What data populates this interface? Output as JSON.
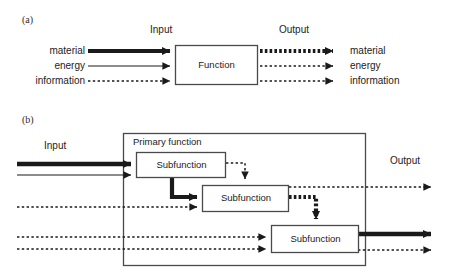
{
  "figure": {
    "background": "#ffffff",
    "stroke_color": "#1a1a1a",
    "box_fill": "#ffffff"
  },
  "panel_a": {
    "id": "(a)",
    "input_heading": "Input",
    "output_heading": "Output",
    "function_box_label": "Function",
    "input_labels": [
      "material",
      "energy",
      "information"
    ],
    "output_labels": [
      "material",
      "energy",
      "information"
    ],
    "flow_styles": [
      "thick-solid",
      "thin-solid",
      "thin-dotted"
    ],
    "output_flow_styles": [
      "thick-dotted",
      "thin-dotted",
      "thin-dotted"
    ]
  },
  "panel_b": {
    "id": "(b)",
    "input_heading": "Input",
    "output_heading": "Output",
    "primary_function_label": "Primary function",
    "subfunction_labels": [
      "Subfunction",
      "Subfunction",
      "Subfunction"
    ],
    "input_flow_styles": [
      "thick-solid",
      "thin-solid",
      "thin-dotted",
      "thin-dotted",
      "thin-dotted"
    ],
    "output_flow_styles": [
      "thin-dotted",
      "thick-solid",
      "thin-dotted"
    ],
    "internal_flow_styles": [
      "thick-solid",
      "thin-dotted",
      "thick-dotted"
    ]
  }
}
